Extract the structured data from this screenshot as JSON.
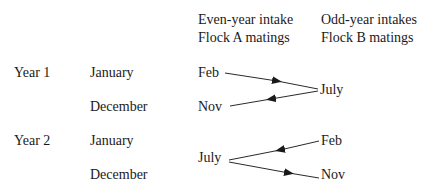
{
  "headers": {
    "flock_a": [
      "Even-year intake",
      "Flock A matings"
    ],
    "flock_b": [
      "Odd-year intakes",
      "Flock B matings"
    ]
  },
  "rows": {
    "year1": {
      "label": "Year 1",
      "months": [
        "January",
        "December"
      ]
    },
    "year2": {
      "label": "Year 2",
      "months": [
        "January",
        "December"
      ]
    }
  },
  "nodes": {
    "y1_a_feb": "Feb",
    "y1_a_nov": "Nov",
    "y1_b_july": "July",
    "y2_a_july": "July",
    "y2_b_feb": "Feb",
    "y2_b_nov": "Nov"
  },
  "edges": [
    {
      "from": "y1_a_feb",
      "to": "y1_b_july"
    },
    {
      "from": "y1_b_july",
      "to": "y1_a_nov"
    },
    {
      "from": "y2_b_feb",
      "to": "y2_a_july"
    },
    {
      "from": "y2_a_july",
      "to": "y2_b_nov"
    }
  ]
}
